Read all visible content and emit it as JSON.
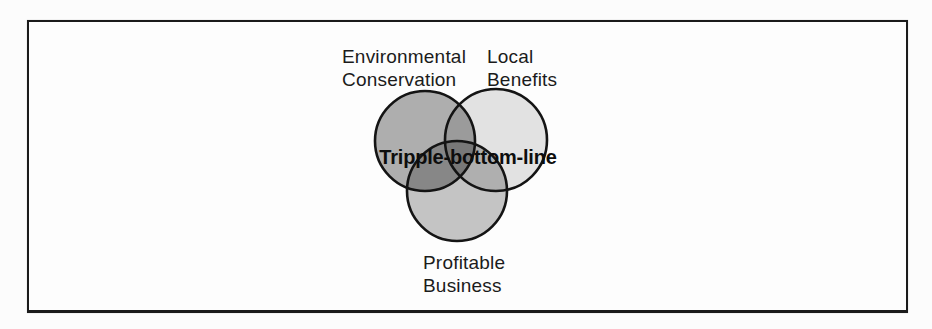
{
  "figure": {
    "kind": "venn-diagram",
    "page_background": "#fcfcfc",
    "frame": {
      "border_color": "#1b1b1b",
      "fill": "#fdfdfd"
    },
    "center_label": "Tripple-bottom-line",
    "outline_color": "#141414",
    "circles": [
      {
        "name": "environmental-conservation",
        "label": "Environmental\nConservation",
        "apparent_fill": "#b0b0b0",
        "layer_alpha": 0.31,
        "cx": 425,
        "cy": 141,
        "r": 50
      },
      {
        "name": "local-benefits",
        "label": "Local\nBenefits",
        "apparent_fill": "#e6e6e6",
        "layer_alpha": 0.105,
        "cx": 496,
        "cy": 140,
        "r": 51
      },
      {
        "name": "profitable-business",
        "label": "Profitable\nBusiness",
        "apparent_fill": "#c6c6c6",
        "layer_alpha": 0.225,
        "cx": 457,
        "cy": 191,
        "r": 50
      }
    ],
    "overlap_note": "pairwise and triple overlaps render darker (multiplicative gray)"
  }
}
